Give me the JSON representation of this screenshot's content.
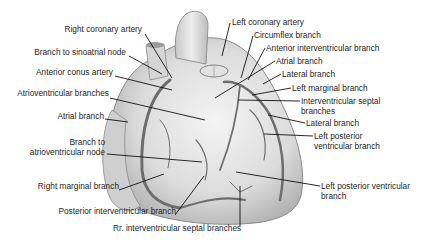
{
  "figure": {
    "labels_left": [
      {
        "id": "right-coronary-artery",
        "text": "Right coronary artery",
        "x": 145,
        "y": 30
      },
      {
        "id": "branch-to-sinoatrial-node",
        "text": "Branch to sinoatrial node",
        "x": 128,
        "y": 53
      },
      {
        "id": "anterior-conus-artery",
        "text": "Anterior conus artery",
        "x": 115,
        "y": 72
      },
      {
        "id": "atrioventricular-branches",
        "text": "Atrioventricular branches",
        "x": 108,
        "y": 94
      },
      {
        "id": "atrial-branch-left",
        "text": "Atrial branch",
        "x": 103,
        "y": 116
      },
      {
        "id": "branch-to-av-node-line1",
        "text": "Branch to",
        "x": 105,
        "y": 143
      },
      {
        "id": "branch-to-av-node-line2",
        "text": "atrioventricular node",
        "x": 105,
        "y": 153
      },
      {
        "id": "right-marginal-branch",
        "text": "Right marginal branch",
        "x": 119,
        "y": 186
      },
      {
        "id": "posterior-interventricular-branch",
        "text": "Posterior interventricular branch",
        "x": 175,
        "y": 212
      },
      {
        "id": "rr-interventricular-septal-branches",
        "text": "Rr. interventricular septal branches",
        "x": 113,
        "y": 228
      }
    ],
    "labels_right": [
      {
        "id": "left-coronary-artery",
        "text": "Left coronary artery",
        "x": 231,
        "y": 19
      },
      {
        "id": "circumflex-branch",
        "text": "Circumflex branch",
        "x": 254,
        "y": 32
      },
      {
        "id": "anterior-interventricular-branch",
        "text": "Anterior interventricular branch",
        "x": 266,
        "y": 45
      },
      {
        "id": "atrial-branch-right",
        "text": "Atrial branch",
        "x": 276,
        "y": 58
      },
      {
        "id": "lateral-branch-upper",
        "text": "Lateral branch",
        "x": 282,
        "y": 71
      },
      {
        "id": "left-marginal-branch",
        "text": "Left marginal branch",
        "x": 292,
        "y": 85
      },
      {
        "id": "interventricular-septal-line1",
        "text": "Interventricular septal",
        "x": 301,
        "y": 98
      },
      {
        "id": "interventricular-septal-line2",
        "text": "branches",
        "x": 301,
        "y": 108
      },
      {
        "id": "lateral-branch-lower",
        "text": "Lateral branch",
        "x": 306,
        "y": 120
      },
      {
        "id": "left-posterior-ventricular-1-line1",
        "text": "Left posterior",
        "x": 314,
        "y": 133
      },
      {
        "id": "left-posterior-ventricular-1-line2",
        "text": "ventricular branch",
        "x": 314,
        "y": 143
      },
      {
        "id": "left-posterior-ventricular-2-line1",
        "text": "Left posterior ventricular",
        "x": 321,
        "y": 183
      },
      {
        "id": "left-posterior-ventricular-2-line2",
        "text": "branch",
        "x": 321,
        "y": 193
      }
    ]
  }
}
